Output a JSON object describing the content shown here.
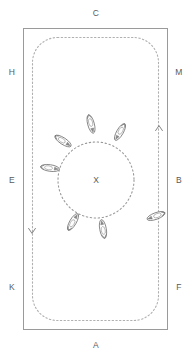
{
  "diagram": {
    "background_color": "#ffffff",
    "arena": {
      "border_color": "#9a9a9a",
      "track_color": "#b0b0b0",
      "x": 23,
      "y": 28,
      "width": 145,
      "height": 302,
      "track_inset": 9,
      "track_corner_radius": 25
    },
    "circle": {
      "label": "X",
      "center_x": 96,
      "center_y": 180,
      "radius": 38,
      "stroke_color": "#9a9a9a"
    },
    "markers": [
      {
        "label": "C",
        "x": 96,
        "y": 13,
        "side": "top"
      },
      {
        "label": "A",
        "x": 96,
        "y": 345,
        "side": "bottom"
      },
      {
        "label": "H",
        "x": 12,
        "y": 72,
        "side": "left"
      },
      {
        "label": "E",
        "x": 12,
        "y": 180,
        "side": "left"
      },
      {
        "label": "K",
        "x": 12,
        "y": 287,
        "side": "left"
      },
      {
        "label": "M",
        "x": 179,
        "y": 72,
        "side": "right"
      },
      {
        "label": "B",
        "x": 179,
        "y": 180,
        "side": "right"
      },
      {
        "label": "F",
        "x": 179,
        "y": 287,
        "side": "right"
      }
    ],
    "direction_arrows": [
      {
        "name": "track-arrow-up-right",
        "x": 159,
        "y": 127,
        "rotation": 0
      },
      {
        "name": "track-arrow-down-left",
        "x": 32,
        "y": 232,
        "rotation": 180
      }
    ],
    "horses": [
      {
        "name": "horse-circle-top",
        "x": 91,
        "y": 124,
        "rotation": 255,
        "location": "circle"
      },
      {
        "name": "horse-circle-top-right",
        "x": 120,
        "y": 132,
        "rotation": 300,
        "location": "circle"
      },
      {
        "name": "horse-circle-upper-left",
        "x": 63,
        "y": 141,
        "rotation": 213,
        "location": "circle"
      },
      {
        "name": "horse-circle-left",
        "x": 50,
        "y": 168,
        "rotation": 188,
        "location": "circle"
      },
      {
        "name": "horse-circle-lower-left",
        "x": 73,
        "y": 222,
        "rotation": 120,
        "location": "circle"
      },
      {
        "name": "horse-circle-bottom",
        "x": 103,
        "y": 229,
        "rotation": 80,
        "location": "circle"
      },
      {
        "name": "horse-track-right",
        "x": 156,
        "y": 216,
        "rotation": 340,
        "location": "track"
      }
    ]
  }
}
